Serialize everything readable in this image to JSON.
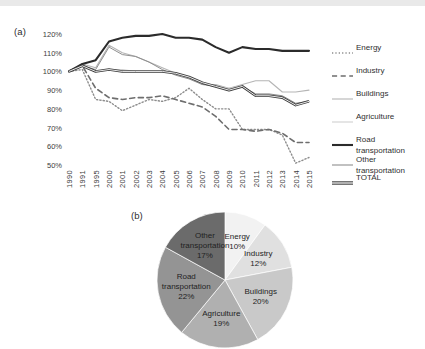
{
  "panel_a": {
    "label": "(a)",
    "y_ticks": [
      "120%",
      "110%",
      "100%",
      "90%",
      "80%",
      "70%",
      "60%",
      "50%"
    ],
    "legend": [
      {
        "name": "Energy",
        "label": "Energy",
        "style": "dotted",
        "color": "#8c8c8c",
        "width": 1.4
      },
      {
        "name": "Industry",
        "label": "Industry",
        "style": "dashed",
        "color": "#6e6e6e",
        "width": 1.6
      },
      {
        "name": "Buildings",
        "label": "Buildings",
        "style": "solid",
        "color": "#b5b5b5",
        "width": 1.1
      },
      {
        "name": "Agriculture",
        "label": "Agriculture",
        "style": "solid",
        "color": "#d0d0d0",
        "width": 1.1
      },
      {
        "name": "Road transportation",
        "label": "Road\ntransportation",
        "style": "solid",
        "color": "#2b2b2b",
        "width": 2.1
      },
      {
        "name": "Other transportation",
        "label": "Other\ntransportation",
        "style": "solid",
        "color": "#8f8f8f",
        "width": 1.0
      },
      {
        "name": "TOTAL",
        "label": "TOTAL",
        "style": "double",
        "color": "#3c3c3c",
        "width": 1.0
      }
    ]
  },
  "panel_b": {
    "label": "(b)"
  },
  "chart_data": [
    {
      "type": "line",
      "title": "",
      "xlabel": "",
      "ylabel": "",
      "ylim": [
        50,
        120
      ],
      "grid": false,
      "legend_position": "right",
      "x": [
        "1990",
        "1991",
        "1995",
        "2000",
        "2001",
        "2002",
        "2003",
        "2004",
        "2005",
        "2006",
        "2007",
        "2008",
        "2009",
        "2010",
        "2011",
        "2012",
        "2013",
        "2014",
        "2015"
      ],
      "series": [
        {
          "name": "Energy",
          "values": [
            100,
            101,
            85,
            84,
            79,
            82,
            85,
            84,
            86,
            91,
            85,
            80,
            80,
            69,
            69,
            69,
            66,
            51,
            54
          ]
        },
        {
          "name": "Industry",
          "values": [
            100,
            103,
            91,
            86,
            85,
            86,
            86,
            87,
            85,
            83,
            81,
            76,
            69,
            69,
            68,
            69,
            67,
            62,
            62
          ]
        },
        {
          "name": "Buildings",
          "values": [
            100,
            104,
            102,
            114,
            110,
            108,
            105,
            102,
            99,
            97,
            93,
            93,
            91,
            93,
            95,
            95,
            89,
            89,
            90
          ]
        },
        {
          "name": "Agriculture",
          "values": [
            100,
            103,
            100,
            101,
            101,
            100,
            100,
            100,
            99,
            97,
            94,
            92,
            91,
            92,
            87,
            87,
            86,
            82,
            84
          ]
        },
        {
          "name": "Road transportation",
          "values": [
            100,
            104,
            106,
            116,
            118,
            119,
            119,
            120,
            118,
            118,
            117,
            113,
            110,
            113,
            112,
            112,
            111,
            111,
            111
          ]
        },
        {
          "name": "Other transportation",
          "values": [
            100,
            103,
            101,
            113,
            109,
            108,
            105,
            101,
            98,
            96,
            93,
            92,
            90,
            92,
            88,
            88,
            87,
            83,
            84
          ]
        },
        {
          "name": "TOTAL",
          "values": [
            100,
            103,
            100,
            101,
            100,
            100,
            100,
            100,
            99,
            97,
            94,
            92,
            90,
            92,
            87,
            87,
            86,
            82,
            84
          ]
        }
      ]
    },
    {
      "type": "pie",
      "title": "",
      "start_angle": 90,
      "direction": "clockwise",
      "categories": [
        "Energy",
        "Industry",
        "Buildings",
        "Agriculture",
        "Road transportation",
        "Other transportation"
      ],
      "values": [
        10,
        12,
        20,
        19,
        22,
        17
      ],
      "labels": [
        "Energy\n10%",
        "Industry\n12%",
        "Buildings\n20%",
        "Agriculture\n19%",
        "Road\ntransportation\n22%",
        "Other\ntransportation\n17%"
      ],
      "colors": [
        "#f2f2f2",
        "#e0e0e0",
        "#c9c9c9",
        "#b0b0b0",
        "#949494",
        "#6b6b6b"
      ]
    }
  ]
}
